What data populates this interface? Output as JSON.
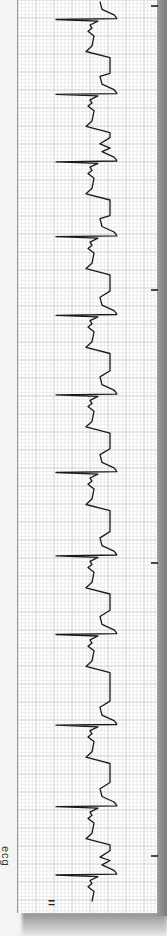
{
  "strip": {
    "orientation": "vertical",
    "grid_color_minor": "#dcdcdc",
    "grid_color_major": "#c4c4c4",
    "trace_color": "#1a1a1a",
    "side_label": "ecg",
    "calibration_mark": "="
  },
  "chart_data": {
    "type": "line",
    "title": "",
    "xlabel": "",
    "ylabel": "",
    "grid": true,
    "time_marks_count": 4,
    "beat_times_fraction": [
      0.02,
      0.1,
      0.172,
      0.252,
      0.336,
      0.421,
      0.504,
      0.593,
      0.677,
      0.774,
      0.861,
      0.934
    ],
    "beat_template": {
      "t": [
        -0.3,
        -0.22,
        -0.12,
        -0.05,
        -0.02,
        0.0,
        0.01,
        0.03,
        0.08,
        0.12,
        0.16,
        0.22,
        0.35,
        0.42,
        0.5,
        0.7
      ],
      "amp": [
        0.35,
        0.1,
        0.15,
        0.45,
        0.5,
        0.52,
        -1.0,
        0.05,
        -0.15,
        -0.1,
        -0.2,
        -0.05,
        -0.1,
        -0.25,
        0.35,
        0.35
      ]
    }
  }
}
